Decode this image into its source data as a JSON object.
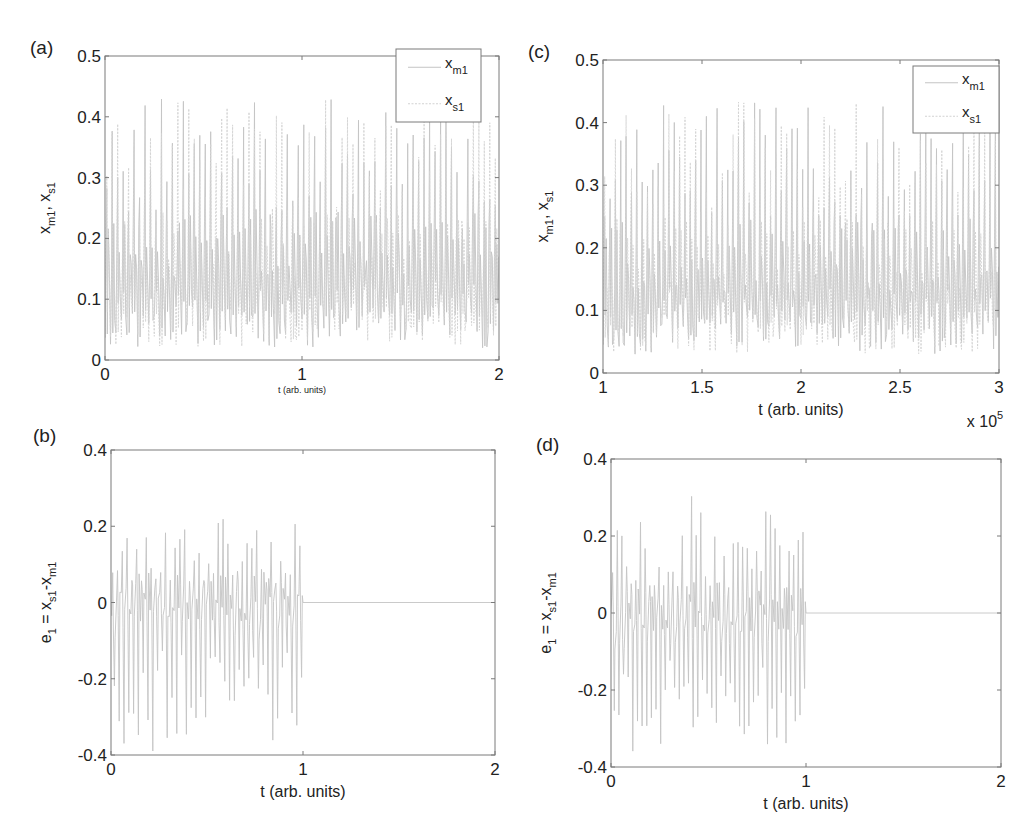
{
  "figure": {
    "width": 1031,
    "height": 832,
    "colors": {
      "axis": "#7a7a7a",
      "trace_master": "#c4c4c4",
      "trace_slave": "#d2d2d2",
      "text": "#222222",
      "background": "#ffffff"
    }
  },
  "chart_data": [
    {
      "id": "a",
      "panel_label": "(a)",
      "type": "line",
      "box": {
        "left": 105,
        "top": 56,
        "right": 499,
        "bottom": 360
      },
      "xlim": [
        0,
        2
      ],
      "ylim": [
        0,
        0.5
      ],
      "xticks": [
        0,
        1,
        2
      ],
      "xtick_labels": [
        "0",
        "1",
        "2"
      ],
      "yticks": [
        0,
        0.1,
        0.2,
        0.3,
        0.4,
        0.5
      ],
      "ytick_labels": [
        "0",
        "0.1",
        "0.2",
        "0.3",
        "0.4",
        "0.5"
      ],
      "xlabel": "t (arb. units)",
      "xlabel_small": true,
      "ylabel": {
        "base1": "x",
        "sub1": "m1",
        "sep": ", ",
        "base2": "x",
        "sub2": "s1"
      },
      "x_multiplier": "",
      "legend": {
        "position": "upper right",
        "box": {
          "left": 396,
          "top": 49,
          "right": 481,
          "bottom": 122
        },
        "entries": [
          {
            "base": "x",
            "sub": "m1"
          },
          {
            "base": "x",
            "sub": "s1"
          }
        ]
      },
      "series": [
        {
          "name": "x_m1",
          "kind": "chaotic",
          "seed": 11,
          "n_spikes": 72,
          "peak_range": [
            0.2,
            0.43
          ],
          "trough_range": [
            0.02,
            0.09
          ],
          "mid": 0.17
        },
        {
          "name": "x_s1",
          "kind": "chaotic",
          "seed": 23,
          "n_spikes": 72,
          "peak_range": [
            0.2,
            0.43
          ],
          "trough_range": [
            0.02,
            0.09
          ],
          "mid": 0.17
        }
      ]
    },
    {
      "id": "b",
      "panel_label": "(b)",
      "type": "line",
      "box": {
        "left": 111,
        "top": 450,
        "right": 495,
        "bottom": 755
      },
      "xlim": [
        0,
        2
      ],
      "ylim": [
        -0.4,
        0.4
      ],
      "xticks": [
        0,
        1,
        2
      ],
      "xtick_labels": [
        "0",
        "1",
        "2"
      ],
      "yticks": [
        -0.4,
        -0.2,
        0,
        0.2,
        0.4
      ],
      "ytick_labels": [
        "-0.4",
        "-0.2",
        "0",
        "0.2",
        "0.4"
      ],
      "xlabel": "t (arb. units)",
      "xlabel_small": false,
      "ylabel": {
        "base1": "e",
        "sub1": "1",
        "sep": " = ",
        "base2": "x",
        "sub2": "s1",
        "sep2": "-",
        "base3": "x",
        "sub3": "m1"
      },
      "x_multiplier": "",
      "legend": null,
      "series": [
        {
          "name": "e_1",
          "kind": "error",
          "seed": 37,
          "n_spikes": 40,
          "switch_t": 1.0,
          "pos_range": [
            0.05,
            0.22
          ],
          "neg_range": [
            -0.39,
            -0.12
          ]
        }
      ]
    },
    {
      "id": "c",
      "panel_label": "(c)",
      "type": "line",
      "box": {
        "left": 603,
        "top": 60,
        "right": 999,
        "bottom": 373
      },
      "xlim": [
        1,
        3
      ],
      "ylim": [
        0,
        0.5
      ],
      "xticks": [
        1,
        1.5,
        2,
        2.5,
        3
      ],
      "xtick_labels": [
        "1",
        "1.5",
        "2",
        "2.5",
        "3"
      ],
      "yticks": [
        0,
        0.1,
        0.2,
        0.3,
        0.4,
        0.5
      ],
      "ytick_labels": [
        "0",
        "0.1",
        "0.2",
        "0.3",
        "0.4",
        "0.5"
      ],
      "xlabel": "t (arb. units)",
      "xlabel_small": false,
      "ylabel": {
        "base1": "x",
        "sub1": "m1",
        "sep": ", ",
        "base2": "x",
        "sub2": "s1"
      },
      "x_multiplier": {
        "base": "x 10",
        "exp": "5"
      },
      "legend": {
        "position": "upper right",
        "box": {
          "left": 913,
          "top": 66,
          "right": 999,
          "bottom": 133
        },
        "entries": [
          {
            "base": "x",
            "sub": "m1"
          },
          {
            "base": "x",
            "sub": "s1"
          }
        ]
      },
      "series": [
        {
          "name": "x_m1",
          "kind": "chaotic",
          "seed": 53,
          "n_spikes": 74,
          "peak_range": [
            0.22,
            0.435
          ],
          "trough_range": [
            0.03,
            0.09
          ],
          "mid": 0.17
        },
        {
          "name": "x_s1",
          "kind": "chaotic",
          "seed": 67,
          "n_spikes": 74,
          "peak_range": [
            0.22,
            0.435
          ],
          "trough_range": [
            0.03,
            0.09
          ],
          "mid": 0.17
        }
      ]
    },
    {
      "id": "d",
      "panel_label": "(d)",
      "type": "line",
      "box": {
        "left": 611,
        "top": 459,
        "right": 1001,
        "bottom": 767
      },
      "xlim": [
        0,
        2
      ],
      "ylim": [
        -0.4,
        0.4
      ],
      "xticks": [
        0,
        1,
        2
      ],
      "xtick_labels": [
        "0",
        "1",
        "2"
      ],
      "yticks": [
        -0.4,
        -0.2,
        0,
        0.2,
        0.4
      ],
      "ytick_labels": [
        "-0.4",
        "-0.2",
        "0",
        "0.2",
        "0.4"
      ],
      "xlabel": "t (arb. units)",
      "xlabel_small": false,
      "ylabel": {
        "base1": "e",
        "sub1": "1",
        "sep": " = ",
        "base2": "x",
        "sub2": "s1",
        "sep2": "-",
        "base3": "x",
        "sub3": "m1"
      },
      "x_multiplier": "",
      "legend": null,
      "series": [
        {
          "name": "e_1",
          "kind": "error",
          "seed": 79,
          "n_spikes": 42,
          "switch_t": 1.0,
          "pos_range": [
            0.06,
            0.31
          ],
          "neg_range": [
            -0.36,
            -0.12
          ]
        }
      ]
    }
  ]
}
